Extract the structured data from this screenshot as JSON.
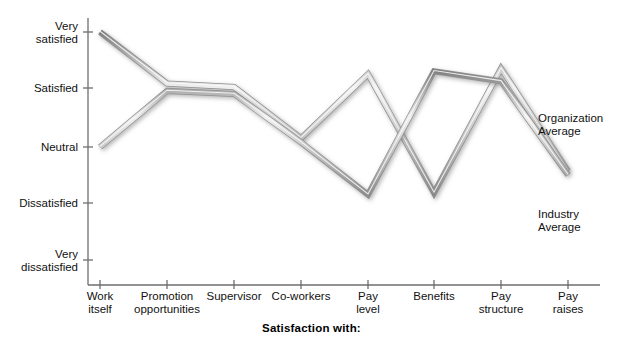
{
  "chart_data": {
    "type": "line",
    "title": "",
    "xlabel": "Satisfaction with:",
    "ylabel": "",
    "grid": false,
    "legend_position": "inline-right",
    "categories": [
      "Work\nitself",
      "Promotion\nopportunities",
      "Supervisor",
      "Co-workers",
      "Pay\nlevel",
      "Benefits",
      "Pay\nstructure",
      "Pay\nraises"
    ],
    "y_ticks": [
      "Very\nsatisfied",
      "Satisfied",
      "Neutral",
      "Dissatisfied",
      "Very\ndissatisfied"
    ],
    "y_scale": [
      5,
      4,
      3,
      2,
      1
    ],
    "ylim": [
      1,
      5
    ],
    "series": [
      {
        "name": "Organization\nAverage",
        "short_name": "Organization Average",
        "color": "#9a9a9a",
        "values": [
          5.0,
          4.08,
          4.02,
          3.15,
          4.25,
          2.18,
          4.35,
          2.57
        ]
      },
      {
        "name": "Industry\nAverage",
        "short_name": "Industry Average",
        "color": "#9a9a9a",
        "values": [
          3.0,
          3.95,
          3.9,
          3.08,
          2.15,
          4.3,
          4.12,
          2.5
        ]
      }
    ],
    "annotations": [
      {
        "text": "Organization\nAverage",
        "x": 540,
        "y": 118
      },
      {
        "text": "Industry\nAverage",
        "x": 540,
        "y": 212
      }
    ]
  },
  "axes": {
    "y_pixels": [
      32,
      88,
      147,
      203,
      260
    ],
    "x_pixels": [
      100,
      167,
      234,
      301,
      368,
      434,
      501,
      568
    ],
    "axis_color": "#6e6e6e",
    "baseline_y": 285,
    "axis_x": 88
  }
}
